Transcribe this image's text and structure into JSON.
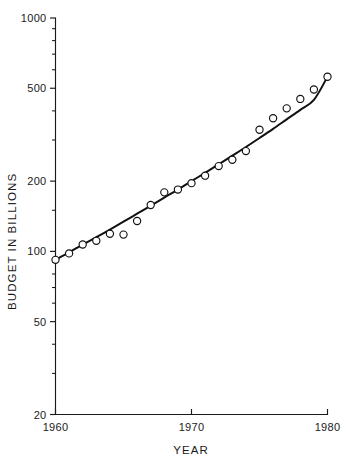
{
  "corner_note": "",
  "chart_data": {
    "type": "scatter",
    "title": "",
    "xlabel": "YEAR",
    "ylabel": "BUDGET IN BILLIONS",
    "xscale": "linear",
    "yscale": "log",
    "xlim": [
      1960,
      1980
    ],
    "ylim": [
      20,
      1000
    ],
    "grid": false,
    "legend": null,
    "x_ticks": [
      1960,
      1970,
      1980
    ],
    "x_tick_labels": [
      "1960",
      "1970",
      "1980"
    ],
    "y_ticks": [
      20,
      50,
      100,
      200,
      500,
      1000
    ],
    "y_tick_labels": [
      "20",
      "50",
      "100",
      "200",
      "500",
      "1000"
    ],
    "y_minor_ticks": [
      30,
      40,
      60,
      70,
      80,
      90,
      150,
      300,
      400,
      600,
      700,
      800,
      900
    ],
    "marker_style": "open-circle",
    "series": [
      {
        "name": "Budget",
        "x": [
          1960,
          1961,
          1962,
          1963,
          1964,
          1965,
          1966,
          1967,
          1968,
          1969,
          1970,
          1971,
          1972,
          1973,
          1974,
          1975,
          1976,
          1977,
          1978,
          1979,
          1980
        ],
        "values": [
          92,
          98,
          107,
          111,
          119,
          118,
          135,
          158,
          179,
          184,
          196,
          211,
          232,
          247,
          269,
          332,
          372,
          410,
          450,
          494,
          560
        ]
      }
    ],
    "fit_curve": {
      "name": "smoothed trend",
      "x": [
        1960,
        1961,
        1962,
        1963,
        1964,
        1965,
        1966,
        1967,
        1968,
        1969,
        1970,
        1971,
        1972,
        1973,
        1974,
        1975,
        1976,
        1977,
        1978,
        1979,
        1980
      ],
      "values": [
        92,
        99,
        107,
        115,
        124,
        134,
        145,
        157,
        170,
        184,
        200,
        217,
        236,
        257,
        280,
        306,
        335,
        368,
        404,
        446,
        560
      ]
    }
  }
}
